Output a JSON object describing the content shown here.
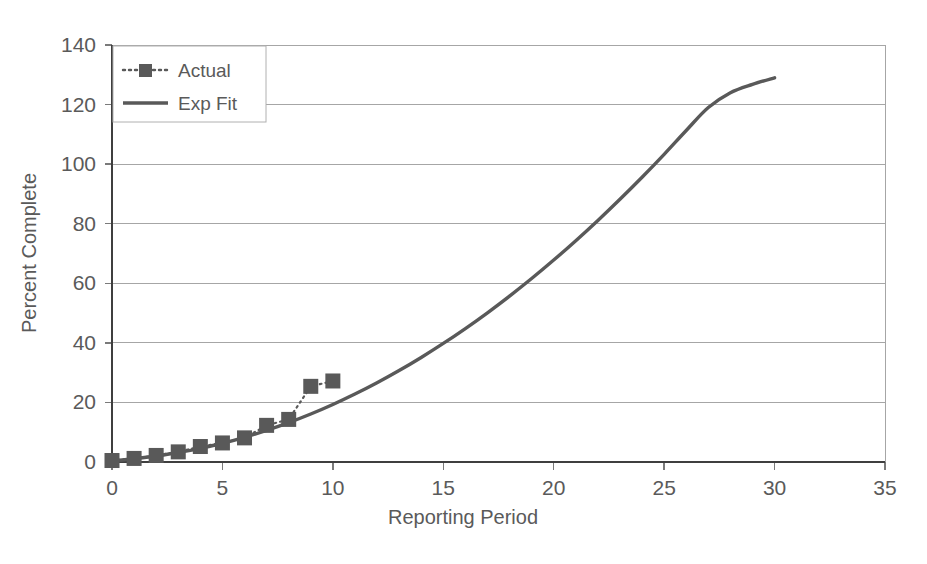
{
  "chart_data": {
    "type": "line",
    "title": "",
    "xlabel": "Reporting Period",
    "ylabel": "Percent Complete",
    "xlim": [
      0,
      35
    ],
    "ylim": [
      0,
      140
    ],
    "xticks": [
      "0",
      "5",
      "10",
      "15",
      "20",
      "25",
      "30",
      "35"
    ],
    "xtick_values": [
      0,
      5,
      10,
      15,
      20,
      25,
      30,
      35
    ],
    "yticks": [
      "0",
      "20",
      "40",
      "60",
      "80",
      "100",
      "120",
      "140"
    ],
    "ytick_values": [
      0,
      20,
      40,
      60,
      80,
      100,
      120,
      140
    ],
    "grid": "horizontal",
    "legend_position": "top-left-inside",
    "series": [
      {
        "name": "Actual",
        "style": "dotted-with-square-markers",
        "color": "#595959",
        "x": [
          0,
          1,
          2,
          3,
          4,
          5,
          6,
          7,
          8,
          9,
          10
        ],
        "values": [
          0.5,
          1.2,
          2.2,
          3.4,
          5.2,
          6.4,
          8.1,
          12.3,
          14.3,
          25.4,
          27.2
        ]
      },
      {
        "name": "Exp Fit",
        "style": "solid-line",
        "color": "#595959",
        "x": [
          0,
          1,
          2,
          3,
          4,
          5,
          6,
          7,
          8,
          9,
          10,
          11,
          12,
          13,
          14,
          15,
          16,
          17,
          18,
          19,
          20,
          21,
          22,
          23,
          24,
          25,
          26,
          27,
          28,
          29,
          30
        ],
        "values": [
          0.4,
          1.1,
          2.0,
          3.2,
          4.6,
          6.3,
          8.3,
          10.6,
          13.2,
          16.1,
          19.3,
          22.8,
          26.6,
          30.7,
          35.1,
          39.8,
          44.8,
          50.1,
          55.7,
          61.6,
          67.8,
          74.3,
          81.1,
          88.2,
          95.6,
          103.3,
          111.3,
          119.0,
          124.0,
          126.8,
          129.0
        ]
      }
    ]
  },
  "legend": {
    "entries": [
      {
        "label": "Actual",
        "marker": "square-dotted"
      },
      {
        "label": "Exp Fit",
        "marker": "solid-line"
      }
    ]
  },
  "colors": {
    "series": "#595959",
    "grid": "#a6a6a6",
    "axis": "#3f3f3f",
    "text": "#5a5a5a",
    "background": "#ffffff"
  }
}
